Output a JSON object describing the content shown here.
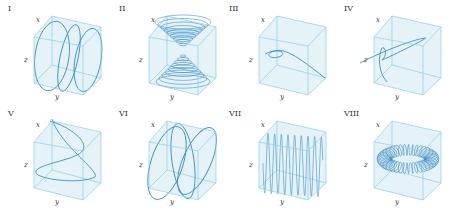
{
  "figure": {
    "colors": {
      "box_fill": "#cfeaf4",
      "box_edge": "#8fcde4",
      "curve": "#3f8fc4",
      "text": "#333333"
    },
    "axis_labels": {
      "x": "x",
      "y": "y",
      "z": "z"
    },
    "panels": [
      {
        "numeral": "I",
        "description": "elliptical helix-like loops along y"
      },
      {
        "numeral": "II",
        "description": "double cone of concentric circles"
      },
      {
        "numeral": "III",
        "description": "curve with a single loop"
      },
      {
        "numeral": "IV",
        "description": "curve rising into a slanted ellipse"
      },
      {
        "numeral": "V",
        "description": "twisted spiral curve"
      },
      {
        "numeral": "VI",
        "description": "intersecting elliptical loops"
      },
      {
        "numeral": "VII",
        "description": "dense vertical oscillation"
      },
      {
        "numeral": "VIII",
        "description": "toroidal spiral (coil wrapped on torus)"
      }
    ]
  }
}
